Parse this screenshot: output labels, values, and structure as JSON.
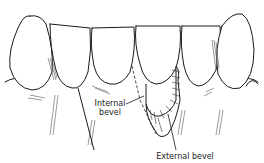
{
  "figure": {
    "labels": {
      "internal_bevel_line1": "Internal",
      "internal_bevel_line2": "bevel",
      "external_bevel": "External bevel"
    },
    "colors": {
      "ink": "#1a1a1a",
      "hatch": "#555555",
      "background": "#ffffff"
    }
  }
}
